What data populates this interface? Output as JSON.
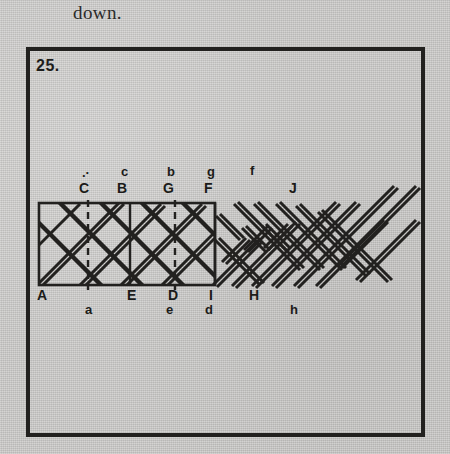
{
  "page": {
    "background_color": "#c9c8c6",
    "ink_color": "#22211f",
    "caption_above": "down."
  },
  "figure": {
    "number_label": "25.",
    "frame": {
      "x": 26,
      "y": 47,
      "width": 399,
      "height": 390,
      "border_color": "#22211f"
    },
    "panel_rect": {
      "x": 39,
      "y": 203,
      "width": 176,
      "height": 82
    }
  },
  "labels": {
    "top_lower": [
      {
        "text": ".·",
        "x": 82,
        "y": 166
      },
      {
        "text": "c",
        "x": 121,
        "y": 165
      },
      {
        "text": "b",
        "x": 167,
        "y": 165
      },
      {
        "text": "g",
        "x": 207,
        "y": 165
      },
      {
        "text": "f",
        "x": 250,
        "y": 164
      }
    ],
    "top_upper": [
      {
        "text": "C",
        "x": 79,
        "y": 181
      },
      {
        "text": "B",
        "x": 117,
        "y": 181
      },
      {
        "text": "G",
        "x": 163,
        "y": 181
      },
      {
        "text": "F",
        "x": 204,
        "y": 181
      },
      {
        "text": "J",
        "x": 289,
        "y": 181
      }
    ],
    "bottom_upper": [
      {
        "text": "A",
        "x": 37,
        "y": 288
      },
      {
        "text": "E",
        "x": 127,
        "y": 288
      },
      {
        "text": "D",
        "x": 168,
        "y": 288
      },
      {
        "text": "I",
        "x": 209,
        "y": 288
      },
      {
        "text": "H",
        "x": 249,
        "y": 288
      }
    ],
    "bottom_lower": [
      {
        "text": "a",
        "x": 85,
        "y": 303
      },
      {
        "text": "e",
        "x": 166,
        "y": 303
      },
      {
        "text": "d",
        "x": 205,
        "y": 303
      },
      {
        "text": "h",
        "x": 290,
        "y": 303
      }
    ]
  },
  "diagram": {
    "dashed_guides_x": [
      88,
      175
    ],
    "solid_dividers_x": [
      130,
      215
    ]
  }
}
